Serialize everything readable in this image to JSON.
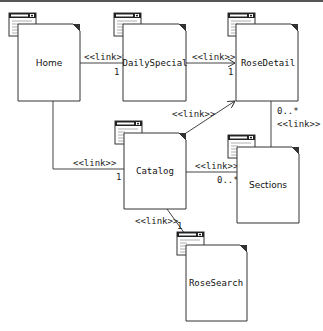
{
  "diagram": {
    "type": "UML web page link diagram",
    "nodes": [
      {
        "id": "home",
        "label": "Home"
      },
      {
        "id": "dailyspecial",
        "label": "DailySpecial"
      },
      {
        "id": "rosedetail",
        "label": "RoseDetail"
      },
      {
        "id": "catalog",
        "label": "Catalog"
      },
      {
        "id": "sections",
        "label": "Sections"
      },
      {
        "id": "rosesearch",
        "label": "RoseSearch"
      }
    ],
    "edges": [
      {
        "from": "Home",
        "to": "DailySpecial",
        "stereotype": "<<link>>",
        "multiplicity": "1"
      },
      {
        "from": "DailySpecial",
        "to": "RoseDetail",
        "stereotype": "<<link>>",
        "multiplicity": "1"
      },
      {
        "from": "Catalog",
        "to": "RoseDetail",
        "stereotype": "<<link>>",
        "multiplicity": ""
      },
      {
        "from": "Home",
        "to": "Catalog",
        "stereotype": "<<link>>",
        "multiplicity": "1"
      },
      {
        "from": "Catalog",
        "to": "Sections",
        "stereotype": "<<link>>",
        "multiplicity": "0..*"
      },
      {
        "from": "Sections",
        "to": "RoseDetail",
        "stereotype": "<<link>>",
        "multiplicity": "0..*"
      },
      {
        "from": "Catalog",
        "to": "RoseSearch",
        "stereotype": "<<link>>",
        "multiplicity": "1"
      }
    ]
  }
}
